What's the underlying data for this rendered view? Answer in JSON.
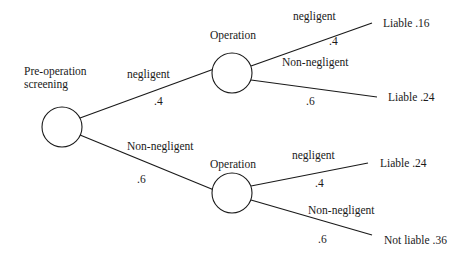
{
  "diagram": {
    "type": "probability-tree",
    "root": {
      "label_line1": "Pre-operation",
      "label_line2": "screening"
    },
    "level1": {
      "upper": {
        "edge_label": "negligent",
        "probability": ".4",
        "node_label": "Operation",
        "branches": {
          "top": {
            "edge_label": "negligent",
            "probability": ".4",
            "outcome": "Liable .16"
          },
          "bottom": {
            "edge_label": "Non-negligent",
            "probability": ".6",
            "outcome": "Liable .24"
          }
        }
      },
      "lower": {
        "edge_label": "Non-negligent",
        "probability": ".6",
        "node_label": "Operation",
        "branches": {
          "top": {
            "edge_label": "negligent",
            "probability": ".4",
            "outcome": "Liable .24"
          },
          "bottom": {
            "edge_label": "Non-negligent",
            "probability": ".6",
            "outcome": "Not liable .36"
          }
        }
      }
    }
  }
}
